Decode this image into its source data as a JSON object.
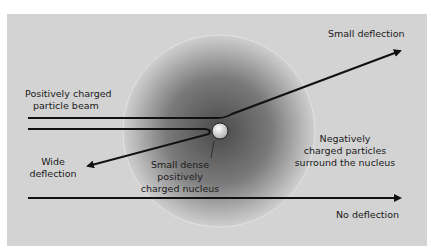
{
  "labels": {
    "small_deflection": "Small deflection",
    "beam_line1": "Positively charged",
    "beam_line2": "particle  beam",
    "wide_line1": "Wide",
    "wide_line2": "deflection",
    "nucleus_line1": "Small dense",
    "nucleus_line2": "positively",
    "nucleus_line3": "charged nucleus",
    "negative_line1": "Negatively",
    "negative_line2": "charged particles",
    "negative_line3": "surround the nucleus",
    "no_deflection": "No deflection"
  },
  "colors": {
    "panel": "#d3d3d3",
    "sphere_center": "#4a4a4a",
    "sphere_edge": "#c8c8c8",
    "line": "#111111"
  }
}
